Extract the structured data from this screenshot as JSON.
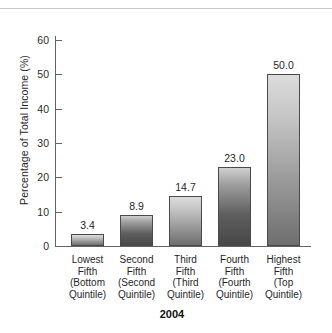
{
  "chart_data": {
    "type": "bar",
    "title": "",
    "caption": "2004",
    "xlabel": "",
    "ylabel": "Percentage of Total Income (%)",
    "ylim": [
      0,
      65
    ],
    "yticks": [
      0,
      10,
      20,
      30,
      40,
      50,
      60
    ],
    "ytick_labels": [
      "0",
      "10",
      "20",
      "30",
      "40",
      "50",
      "60"
    ],
    "grid": false,
    "legend": "none",
    "categories": [
      "Lowest Fifth (Bottom Quintile)",
      "Second Fifth (Second Quintile)",
      "Third Fifth (Third Quintile)",
      "Fourth Fifth (Fourth Quintile)",
      "Highest Fifth (Top Quintile)"
    ],
    "category_lines": [
      [
        "Lowest",
        "Fifth",
        "(Bottom",
        "Quintile)"
      ],
      [
        "Second",
        "Fifth",
        "(Second",
        "Quintile)"
      ],
      [
        "Third",
        "Fifth",
        "(Third",
        "Quintile)"
      ],
      [
        "Fourth",
        "Fifth",
        "(Fourth",
        "Quintile)"
      ],
      [
        "Highest",
        "Fifth",
        "(Top",
        "Quintile)"
      ]
    ],
    "values": [
      3.4,
      8.9,
      14.7,
      23.0,
      50.0
    ],
    "value_labels": [
      "3.4",
      "8.9",
      "14.7",
      "23.0",
      "50.0"
    ],
    "colors": {
      "bar_top": "#dcdcdc",
      "bar_bottom": "#6e6e6e",
      "bar_border": "#4a4a4a",
      "axis": "#636363",
      "text": "#1f1f1f",
      "background": "#ffffff",
      "rule": "#c9c9c9"
    }
  }
}
